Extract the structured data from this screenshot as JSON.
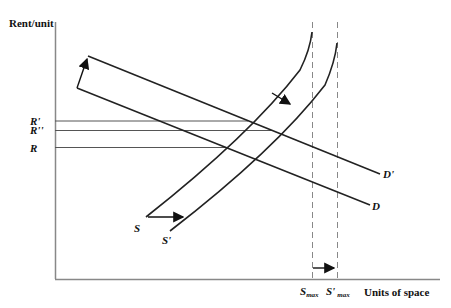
{
  "diagram": {
    "type": "supply-demand",
    "axes": {
      "y_label": "Rent/unit",
      "x_label": "Units of space"
    },
    "rent_levels": [
      {
        "label": "R'",
        "key": "R_prime"
      },
      {
        "label": "R''",
        "key": "R_double_prime"
      },
      {
        "label": "R",
        "key": "R"
      }
    ],
    "curves": {
      "demand": "D",
      "demand_shifted": "D'",
      "supply": "S",
      "supply_shifted": "S'"
    },
    "capacity": {
      "s_max_main": "S",
      "s_max_sub": "max",
      "s_prime_max_main": "S'",
      "s_prime_max_sub": "max"
    },
    "colors": {
      "line": "#222222",
      "axis": "#888888",
      "dash": "#888888"
    }
  }
}
